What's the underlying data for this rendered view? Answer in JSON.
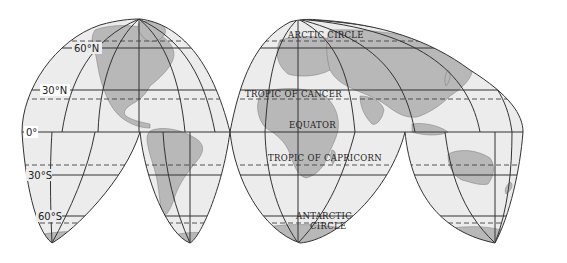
{
  "map": {
    "projection": "interrupted homolosine",
    "colors": {
      "ocean": "#ececec",
      "land": "#b8b8b8",
      "grid": "#333333",
      "background": "#ffffff"
    },
    "latitude_labels": [
      {
        "text": "60°N",
        "lat": 60
      },
      {
        "text": "30°N",
        "lat": 30
      },
      {
        "text": "0°",
        "lat": 0
      },
      {
        "text": "30°S",
        "lat": -30
      },
      {
        "text": "60°S",
        "lat": -60
      }
    ],
    "special_lines": {
      "arctic": "ARCTIC CIRCLE",
      "cancer": "TROPIC OF CANCER",
      "equator": "EQUATOR",
      "capricorn": "TROPIC OF CAPRICORN",
      "antarctic_1": "ANTARCTIC",
      "antarctic_2": "CIRCLE"
    }
  }
}
